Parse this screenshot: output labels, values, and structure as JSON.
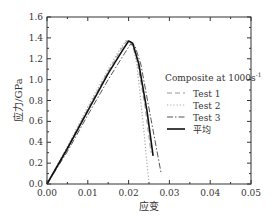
{
  "chart_data": {
    "type": "line",
    "title": "",
    "xlabel": "应变",
    "ylabel": "应力/GPa",
    "xlim": [
      0,
      0.05
    ],
    "ylim": [
      0,
      1.6
    ],
    "xticks": [
      "0.00",
      "0.01",
      "0.02",
      "0.03",
      "0.04",
      "0.05"
    ],
    "yticks": [
      "0.0",
      "0.2",
      "0.4",
      "0.6",
      "0.8",
      "1.0",
      "1.2",
      "1.4",
      "1.6"
    ],
    "grid": false,
    "legend": {
      "title": "Composite at 1000s",
      "title_superscript": "-1",
      "position": "right-center",
      "entries": [
        "Test 1",
        "Test 2",
        "Test 3",
        "平均"
      ]
    },
    "series": [
      {
        "name": "Test 1",
        "style": "dashed",
        "color": "#999999",
        "x": [
          0,
          0.005,
          0.01,
          0.015,
          0.018,
          0.0195,
          0.0205,
          0.022,
          0.024,
          0.0255
        ],
        "y": [
          0,
          0.35,
          0.72,
          1.08,
          1.28,
          1.37,
          1.37,
          1.2,
          0.75,
          0.3
        ]
      },
      {
        "name": "Test 2",
        "style": "dotted",
        "color": "#aaaaaa",
        "x": [
          0,
          0.005,
          0.01,
          0.015,
          0.018,
          0.0195,
          0.021,
          0.022,
          0.0235,
          0.025
        ],
        "y": [
          0,
          0.36,
          0.74,
          1.1,
          1.3,
          1.38,
          1.33,
          1.15,
          0.6,
          0.0
        ]
      },
      {
        "name": "Test 3",
        "style": "dashdot",
        "color": "#555555",
        "x": [
          0,
          0.005,
          0.01,
          0.015,
          0.019,
          0.0205,
          0.0215,
          0.023,
          0.0255,
          0.028
        ],
        "y": [
          0,
          0.31,
          0.66,
          1.0,
          1.25,
          1.34,
          1.33,
          1.15,
          0.62,
          0.1
        ]
      },
      {
        "name": "平均",
        "style": "solid",
        "color": "#111111",
        "x": [
          0,
          0.005,
          0.01,
          0.015,
          0.0185,
          0.02,
          0.021,
          0.0225,
          0.0245,
          0.026
        ],
        "y": [
          0,
          0.34,
          0.7,
          1.06,
          1.28,
          1.37,
          1.35,
          1.15,
          0.7,
          0.27
        ]
      }
    ]
  }
}
